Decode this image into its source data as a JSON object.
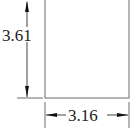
{
  "diagram": {
    "shape": "rectangle",
    "height_label": "3.61",
    "width_label": "3.16",
    "colors": {
      "line": "#555555",
      "arrow": "#111111",
      "text": "#222222",
      "background": "#ffffff"
    }
  }
}
